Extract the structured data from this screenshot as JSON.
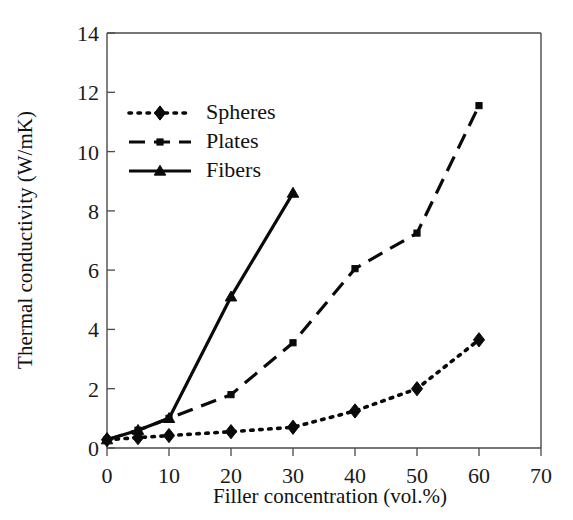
{
  "chart_data": {
    "type": "line",
    "title": "",
    "xlabel": "Filler concentration (vol.%)",
    "ylabel": "Thermal conductivity (W/mK)",
    "xlim": [
      0,
      70
    ],
    "ylim": [
      0,
      14
    ],
    "xticks": [
      0,
      10,
      20,
      30,
      40,
      50,
      60,
      70
    ],
    "yticks": [
      0,
      2,
      4,
      6,
      8,
      10,
      12,
      14
    ],
    "xtick_labels": [
      "0",
      "10",
      "20",
      "30",
      "40",
      "50",
      "60",
      "70"
    ],
    "ytick_labels": [
      "0",
      "2",
      "4",
      "6",
      "8",
      "10",
      "12",
      "14"
    ],
    "grid": false,
    "legend_position": "upper-left",
    "series": [
      {
        "name": "Spheres",
        "marker": "diamond",
        "line_style": "dotted",
        "color": "#0a0a0a",
        "x": [
          0,
          5,
          10,
          20,
          30,
          40,
          50,
          60
        ],
        "values": [
          0.28,
          0.35,
          0.42,
          0.55,
          0.7,
          1.25,
          2.0,
          3.65
        ]
      },
      {
        "name": "Plates",
        "marker": "square",
        "line_style": "dashed",
        "color": "#0a0a0a",
        "x": [
          0,
          5,
          10,
          20,
          30,
          40,
          50,
          60
        ],
        "values": [
          0.28,
          0.6,
          1.0,
          1.8,
          3.55,
          6.05,
          7.25,
          11.55
        ]
      },
      {
        "name": "Fibers",
        "marker": "triangle",
        "line_style": "solid",
        "color": "#0a0a0a",
        "x": [
          0,
          5,
          10,
          20,
          30
        ],
        "values": [
          0.28,
          0.6,
          1.0,
          5.1,
          8.6
        ]
      }
    ]
  },
  "legend": {
    "entries": [
      {
        "label": "Spheres"
      },
      {
        "label": "Plates"
      },
      {
        "label": "Fibers"
      }
    ]
  },
  "axes": {
    "x_title": "Filler concentration (vol.%)",
    "y_title": "Thermal conductivity (W/mK)"
  }
}
